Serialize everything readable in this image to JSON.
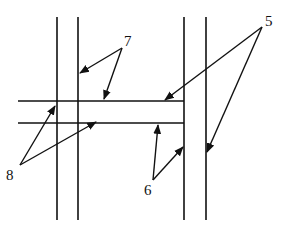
{
  "diagram": {
    "labels": {
      "five": "5",
      "six": "6",
      "seven": "7",
      "eight": "8"
    },
    "colors": {
      "line": "#111111",
      "background": "#ffffff"
    }
  }
}
